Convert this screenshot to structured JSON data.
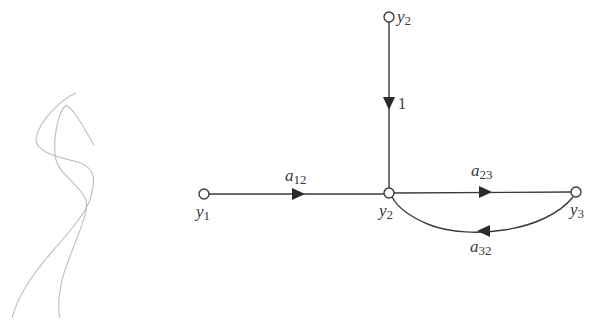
{
  "diagram": {
    "type": "signal-flow-graph",
    "colors": {
      "stroke": "#3a3a3a",
      "sketch": "#b8b8b8",
      "background": "#ffffff"
    },
    "nodes": [
      {
        "id": "y2_top",
        "var": "y",
        "sub": "2",
        "x": 389,
        "y": 17
      },
      {
        "id": "y1",
        "var": "y",
        "sub": "1",
        "x": 204,
        "y": 194
      },
      {
        "id": "y2_mid",
        "var": "y",
        "sub": "2",
        "x": 389,
        "y": 193
      },
      {
        "id": "y3",
        "var": "y",
        "sub": "3",
        "x": 576,
        "y": 192
      }
    ],
    "branches": [
      {
        "from": "y2_top",
        "to": "y2_mid",
        "gain": "1"
      },
      {
        "from": "y1",
        "to": "y2_mid",
        "gain_var": "a",
        "gain_sub": "12"
      },
      {
        "from": "y2_mid",
        "to": "y3",
        "gain_var": "a",
        "gain_sub": "23"
      },
      {
        "from": "y3",
        "to": "y2_mid",
        "gain_var": "a",
        "gain_sub": "32"
      }
    ]
  }
}
